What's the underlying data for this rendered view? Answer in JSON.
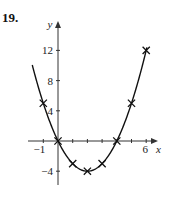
{
  "problem_number": "19.",
  "chart_data": {
    "type": "line",
    "title": "",
    "xlabel": "x",
    "ylabel": "y",
    "curve": "y = x^2 - 4x",
    "x": [
      -1,
      0,
      1,
      2,
      3,
      4,
      5,
      6
    ],
    "y": [
      5,
      0,
      -3,
      -4,
      -3,
      0,
      5,
      12
    ],
    "marker": "x",
    "x_ticks": [
      -1,
      0,
      1,
      2,
      3,
      4,
      5,
      6
    ],
    "x_tick_labels": [
      "-1",
      "6"
    ],
    "y_ticks": [
      -4,
      4,
      8,
      12
    ],
    "y_tick_labels": [
      "-4",
      "4",
      "8",
      "12"
    ],
    "xlim": [
      -2,
      6.8
    ],
    "ylim": [
      -6,
      16
    ],
    "grid": false,
    "legend": null
  }
}
